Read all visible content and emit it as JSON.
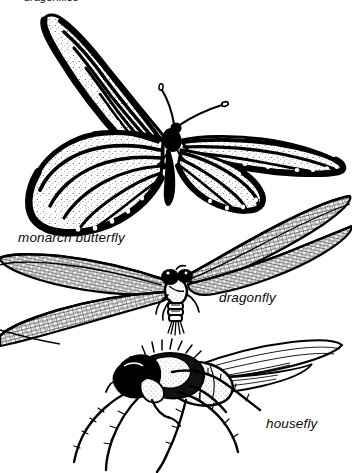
{
  "figure": {
    "title_cut_off": "dragonflies",
    "background_color": "#ffffff",
    "ink_color": "#000000",
    "width": 352,
    "height": 473,
    "style": "black-and-white pen-and-ink scientific line illustration"
  },
  "labels": {
    "monarch": "monarch butterfly",
    "dragonfly": "dragonfly",
    "housefly": "housefly"
  },
  "specimens": [
    {
      "name": "monarch butterfly",
      "label": "monarch butterfly",
      "order": 1,
      "description": "Butterfly with fully spread wings, dark veins, pale cells and white marginal spots"
    },
    {
      "name": "dragonfly",
      "label": "dragonfly",
      "order": 2,
      "description": "Dragonfly with four long narrow net-veined wings and large dark compound eyes"
    },
    {
      "name": "housefly",
      "label": "housefly",
      "order": 3,
      "description": "Housefly in side profile with bristled legs, dark thorax and large compound eye"
    }
  ]
}
